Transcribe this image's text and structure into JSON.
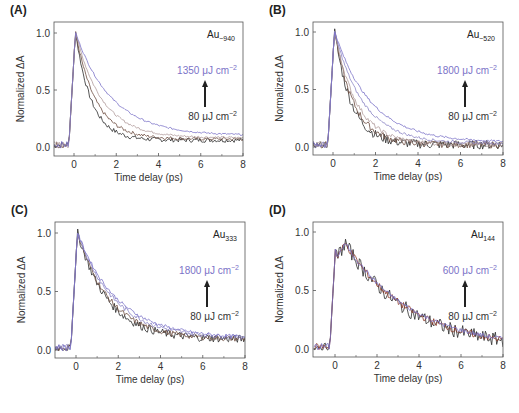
{
  "figure": {
    "panel_label_color": "#222222",
    "axis_color": "#555555",
    "text_color": "#333333",
    "high_fluence_color": "#7b72c8"
  },
  "chart_data": [
    {
      "panel": "(A)",
      "type": "line",
      "sample_label": "Au",
      "sample_subscript": "~940",
      "xlabel": "Time delay (ps)",
      "ylabel": "Normalized ΔA",
      "xlim": [
        -1,
        8
      ],
      "ylim": [
        -0.05,
        1.05
      ],
      "xticks": [
        0,
        2,
        4,
        6,
        8
      ],
      "yticks": [
        "0.0",
        "0.5",
        "1.0"
      ],
      "fluence_high": "1350 μJ cm",
      "fluence_low": "80 μJ cm",
      "exponent": "−2",
      "frame": {
        "left": 54,
        "top": 22,
        "right": 243,
        "bottom": 156,
        "x0": 74,
        "y0": 147,
        "y1": 33
      },
      "series": [
        {
          "name": "80 μJ cm−2",
          "color": "#2a2a2a",
          "rise": 0.0,
          "tau": 0.75,
          "offset": 0.06,
          "noise": 0.02
        },
        {
          "name": "mid-1",
          "color": "#6b4a3e",
          "rise": 0.0,
          "tau": 0.95,
          "offset": 0.07,
          "noise": 0.015
        },
        {
          "name": "mid-2",
          "color": "#b09a9a",
          "rise": 0.0,
          "tau": 1.25,
          "offset": 0.08,
          "noise": 0.01
        },
        {
          "name": "1350 μJ cm−2",
          "color": "#7b72c8",
          "rise": 0.0,
          "tau": 1.7,
          "offset": 0.1,
          "noise": 0.008
        }
      ]
    },
    {
      "panel": "(B)",
      "type": "line",
      "sample_label": "Au",
      "sample_subscript": "~520",
      "xlabel": "Time delay (ps)",
      "ylabel": "Normalized ΔA",
      "xlim": [
        -1,
        8
      ],
      "ylim": [
        -0.05,
        1.05
      ],
      "xticks": [
        0,
        2,
        4,
        6,
        8
      ],
      "yticks": [
        "0.0",
        "0.5",
        "1.0"
      ],
      "fluence_high": "1800 μJ cm",
      "fluence_low": "80 μJ cm",
      "exponent": "−2",
      "frame": {
        "left": 313,
        "top": 22,
        "right": 503,
        "bottom": 155,
        "x0": 333,
        "y0": 147,
        "y1": 32
      },
      "series": [
        {
          "name": "80 μJ cm−2",
          "color": "#2a2a2a",
          "rise": 0.0,
          "tau": 0.8,
          "offset": 0.02,
          "noise": 0.04
        },
        {
          "name": "mid-1",
          "color": "#6b4a3e",
          "rise": 0.0,
          "tau": 0.9,
          "offset": 0.02,
          "noise": 0.03
        },
        {
          "name": "mid-2",
          "color": "#b09a9a",
          "rise": 0.0,
          "tau": 1.05,
          "offset": 0.02,
          "noise": 0.02
        },
        {
          "name": "mid-3",
          "color": "#8a84c4",
          "rise": 0.0,
          "tau": 1.35,
          "offset": 0.03,
          "noise": 0.012
        },
        {
          "name": "1800 μJ cm−2",
          "color": "#7b72c8",
          "rise": 0.0,
          "tau": 1.7,
          "offset": 0.04,
          "noise": 0.01
        }
      ]
    },
    {
      "panel": "(C)",
      "type": "line",
      "sample_label": "Au",
      "sample_subscript": "333",
      "xlabel": "Time delay (ps)",
      "ylabel": "Normalized ΔA",
      "xlim": [
        -1,
        8
      ],
      "ylim": [
        -0.05,
        1.05
      ],
      "xticks": [
        0,
        2,
        4,
        6,
        8
      ],
      "yticks": [
        "0.0",
        "0.5",
        "1.0"
      ],
      "fluence_high": "1800 μJ cm",
      "fluence_low": "80 μJ cm",
      "exponent": "−2",
      "frame": {
        "left": 55,
        "top": 222,
        "right": 245,
        "bottom": 358,
        "x0": 76,
        "y0": 350,
        "y1": 233
      },
      "series": [
        {
          "name": "80 μJ cm−2",
          "color": "#2a2a2a",
          "rise": 0.0,
          "tau": 1.45,
          "offset": 0.09,
          "noise": 0.035
        },
        {
          "name": "mid-1",
          "color": "#6b4a3e",
          "rise": 0.0,
          "tau": 1.55,
          "offset": 0.09,
          "noise": 0.025
        },
        {
          "name": "mid-2",
          "color": "#8a84c4",
          "rise": 0.0,
          "tau": 1.75,
          "offset": 0.1,
          "noise": 0.02
        },
        {
          "name": "1800 μJ cm−2",
          "color": "#7b72c8",
          "rise": 0.0,
          "tau": 1.9,
          "offset": 0.1,
          "noise": 0.015
        }
      ]
    },
    {
      "panel": "(D)",
      "type": "line",
      "sample_label": "Au",
      "sample_subscript": "144",
      "xlabel": "Time delay (ps)",
      "ylabel": "Normalized ΔA",
      "xlim": [
        -1,
        8
      ],
      "ylim": [
        -0.05,
        1.05
      ],
      "xticks": [
        0,
        2,
        4,
        6,
        8
      ],
      "yticks": [
        "0.0",
        "0.5",
        "1.0"
      ],
      "fluence_high": "600 μJ cm",
      "fluence_low": "80 μJ cm",
      "exponent": "−2",
      "frame": {
        "left": 313,
        "top": 222,
        "right": 503,
        "bottom": 357,
        "x0": 335,
        "y0": 349,
        "y1": 232
      },
      "series": [
        {
          "name": "80 μJ cm−2",
          "color": "#2a2a2a",
          "rise": 0.5,
          "tau": 3.0,
          "offset": 0.0,
          "noise": 0.06
        },
        {
          "name": "mid-1",
          "color": "#8a3a2a",
          "rise": 0.5,
          "tau": 3.1,
          "offset": 0.0,
          "noise": 0.03
        },
        {
          "name": "600 μJ cm−2",
          "color": "#7b72c8",
          "rise": 0.5,
          "tau": 3.2,
          "offset": 0.01,
          "noise": 0.02
        }
      ]
    }
  ]
}
